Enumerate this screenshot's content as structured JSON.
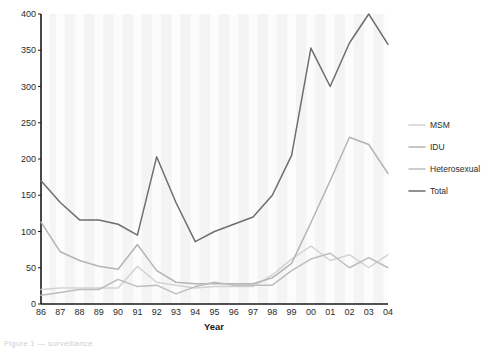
{
  "chart_data": {
    "type": "line",
    "title": "",
    "xlabel": "Year",
    "ylabel": "",
    "categories": [
      "86",
      "87",
      "88",
      "89",
      "90",
      "91",
      "92",
      "93",
      "94",
      "95",
      "96",
      "97",
      "98",
      "99",
      "00",
      "01",
      "02",
      "03",
      "04"
    ],
    "ylim": [
      0,
      400
    ],
    "yticks": [
      0,
      50,
      100,
      150,
      200,
      250,
      300,
      350,
      400
    ],
    "grid": "vertical-bands",
    "legend_position": "right",
    "series": [
      {
        "name": "MSM",
        "color": "#d3d3d3",
        "values": [
          20,
          22,
          22,
          22,
          22,
          52,
          30,
          26,
          22,
          24,
          24,
          24,
          40,
          62,
          80,
          60,
          68,
          50,
          68
        ]
      },
      {
        "name": "IDU",
        "color": "#b4b4b4",
        "values": [
          113,
          72,
          60,
          52,
          48,
          82,
          46,
          30,
          28,
          28,
          28,
          28,
          36,
          56,
          112,
          170,
          230,
          220,
          180
        ]
      },
      {
        "name": "Heterosexual",
        "color": "#bdbdbd",
        "values": [
          12,
          16,
          20,
          20,
          34,
          24,
          26,
          14,
          24,
          30,
          26,
          26,
          26,
          46,
          62,
          70,
          50,
          64,
          50
        ]
      },
      {
        "name": "Total",
        "color": "#6e6e6e",
        "values": [
          170,
          140,
          116,
          116,
          110,
          95,
          203,
          140,
          86,
          100,
          110,
          120,
          150,
          205,
          353,
          300,
          360,
          400,
          358
        ]
      }
    ]
  },
  "footnote": "Figure 1 — surveillance"
}
